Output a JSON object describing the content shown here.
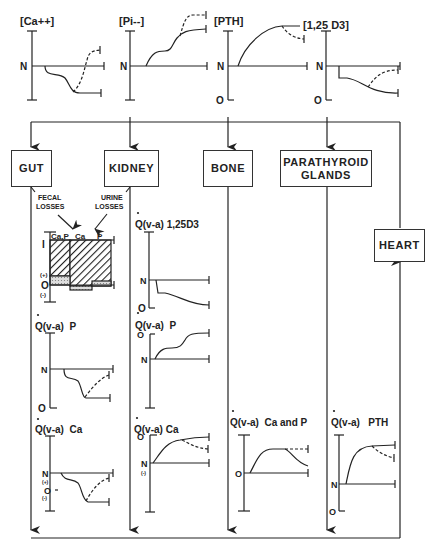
{
  "top_graphs": [
    {
      "label": "[Ca++]",
      "axis_labels": [
        "N"
      ]
    },
    {
      "label": "[Pi--]",
      "axis_labels": [
        "N"
      ]
    },
    {
      "label": "[PTH]",
      "axis_labels": [
        "N",
        "O"
      ]
    },
    {
      "label": "[1,25 D3]",
      "axis_labels": [
        "N",
        "O"
      ]
    }
  ],
  "organs": {
    "gut": "GUT",
    "kidney": "KIDNEY",
    "bone": "BONE",
    "parathyroid_line1": "PARATHYROID",
    "parathyroid_line2": "GLANDS",
    "heart": "HEART"
  },
  "losses": {
    "fecal_line1": "FECAL",
    "fecal_line2": "LOSSES",
    "urine_line1": "URINE",
    "urine_line2": "LOSSES"
  },
  "balance_chart": {
    "columns": [
      "Ca,P",
      "Ca",
      "P"
    ],
    "axis_labels": [
      "I",
      "(+)",
      "O",
      "(-)"
    ]
  },
  "gut_graphs": [
    {
      "title": "Q(v-a)  P",
      "axis_labels": [
        "N",
        "O"
      ]
    },
    {
      "title": "Q(v-a)  Ca",
      "axis_labels": [
        "N",
        "(+)",
        "O",
        "(-)"
      ]
    }
  ],
  "kidney_graphs": [
    {
      "title": "Q(v-a) 1,25D3",
      "axis_labels": [
        "N",
        "O"
      ]
    },
    {
      "title": "Q(v-a)  P",
      "axis_labels": [
        "O",
        "N"
      ]
    },
    {
      "title": "Q(v-a) Ca",
      "axis_labels": [
        "O",
        "N",
        "(-)"
      ]
    }
  ],
  "bone_graph": {
    "title": "Q(v-a)  Ca and P",
    "axis_labels": [
      "O"
    ]
  },
  "parathyroid_graph": {
    "title": "Q(v-a)   PTH",
    "axis_labels": [
      "N",
      "O"
    ]
  },
  "colors": {
    "ink": "#222222",
    "background": "#ffffff",
    "hatch_fill": "#bbbbbb"
  }
}
